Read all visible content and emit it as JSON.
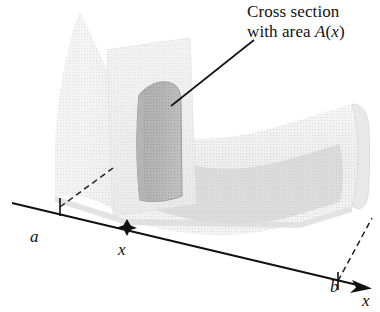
{
  "figure": {
    "kind": "solid-with-cross-section-diagram",
    "caption_lines": [
      "Cross section",
      "with area A(x)"
    ],
    "annotation": {
      "line1": "Cross section",
      "line2_prefix": "with area ",
      "line2_fn": "A",
      "line2_open": "(",
      "line2_var": "x",
      "line2_close": ")"
    },
    "axis": {
      "name": "x-axis",
      "label": "x",
      "ticks": [
        {
          "id": "a",
          "label": "a",
          "type": "tick",
          "x": 60,
          "y": 207
        },
        {
          "id": "x",
          "label": "x",
          "type": "point",
          "x": 127,
          "y": 228
        },
        {
          "id": "b",
          "label": "b",
          "type": "tick",
          "x": 338,
          "y": 281
        }
      ]
    },
    "colors": {
      "ink": "#111111",
      "solid_light": "#efefef",
      "solid_mid": "#e2e2e2",
      "solid_shade": "#d4d4d4",
      "cutting_plane": "#e8e8e8",
      "cross_section": "#a6a6a6",
      "cross_section_edge": "#8f8f8f",
      "dashed": "#222222"
    }
  }
}
